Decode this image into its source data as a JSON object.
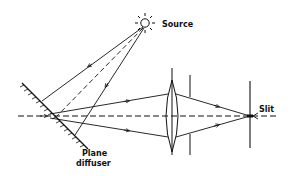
{
  "figure": {
    "labels": {
      "source": "Source",
      "diffuser_line1": "Plane",
      "diffuser_line2": "diffuser",
      "slit": "Slit"
    },
    "colors": {
      "ink": "#111111",
      "background": "#ffffff"
    },
    "components": [
      "source",
      "plane diffuser",
      "lens",
      "aperture stop",
      "slit",
      "optical axis"
    ]
  }
}
